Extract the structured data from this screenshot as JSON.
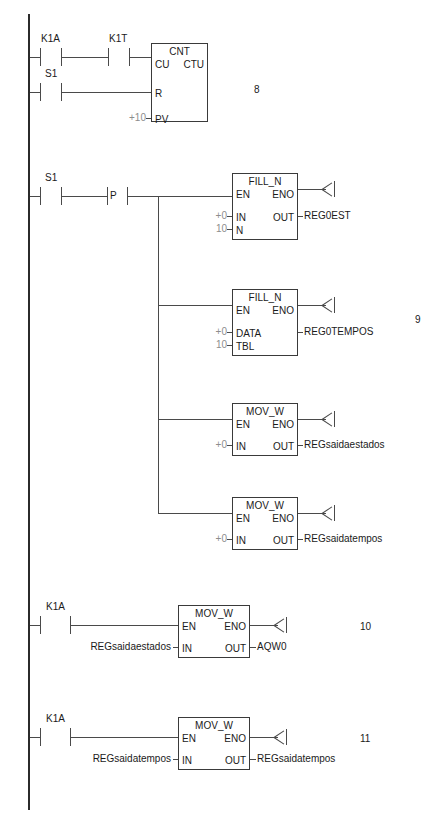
{
  "diagram": {
    "type": "ladder-logic",
    "rungs": [
      {
        "number": "8",
        "contacts": [
          {
            "label": "K1A",
            "type": "normally-open"
          },
          {
            "label": "K1T",
            "type": "normally-open"
          },
          {
            "label": "S1",
            "type": "normally-open"
          }
        ],
        "block": {
          "name": "CNT",
          "type_label": "CTU",
          "inputs": [
            {
              "pin": "CU",
              "operand": ""
            },
            {
              "pin": "R",
              "operand": ""
            },
            {
              "pin": "PV",
              "operand": "+10"
            }
          ],
          "outputs": []
        }
      },
      {
        "number": "9",
        "contacts": [
          {
            "label": "S1",
            "type": "normally-open"
          },
          {
            "label": "P",
            "type": "positive-transition"
          }
        ],
        "blocks": [
          {
            "name": "FILL_N",
            "inputs": [
              {
                "pin": "EN",
                "operand": ""
              },
              {
                "pin": "IN",
                "operand": "+0"
              },
              {
                "pin": "N",
                "operand": "10"
              }
            ],
            "outputs": [
              {
                "pin": "ENO",
                "operand": ""
              },
              {
                "pin": "OUT",
                "operand": "REG0EST"
              }
            ]
          },
          {
            "name": "FILL_N",
            "inputs": [
              {
                "pin": "EN",
                "operand": ""
              },
              {
                "pin": "DATA",
                "operand": "+0"
              },
              {
                "pin": "TBL",
                "operand": "10"
              }
            ],
            "outputs": [
              {
                "pin": "ENO",
                "operand": ""
              },
              {
                "pin": "",
                "operand": "REG0TEMPOS"
              }
            ]
          },
          {
            "name": "MOV_W",
            "inputs": [
              {
                "pin": "EN",
                "operand": ""
              },
              {
                "pin": "IN",
                "operand": "+0"
              }
            ],
            "outputs": [
              {
                "pin": "ENO",
                "operand": ""
              },
              {
                "pin": "OUT",
                "operand": "REGsaidaestados"
              }
            ]
          },
          {
            "name": "MOV_W",
            "inputs": [
              {
                "pin": "EN",
                "operand": ""
              },
              {
                "pin": "IN",
                "operand": "+0"
              }
            ],
            "outputs": [
              {
                "pin": "ENO",
                "operand": ""
              },
              {
                "pin": "OUT",
                "operand": "REGsaidatempos"
              }
            ]
          }
        ]
      },
      {
        "number": "10",
        "contacts": [
          {
            "label": "K1A",
            "type": "normally-open"
          }
        ],
        "block": {
          "name": "MOV_W",
          "inputs": [
            {
              "pin": "EN",
              "operand": ""
            },
            {
              "pin": "IN",
              "operand": "REGsaidaestados"
            }
          ],
          "outputs": [
            {
              "pin": "ENO",
              "operand": ""
            },
            {
              "pin": "OUT",
              "operand": "AQW0"
            }
          ]
        }
      },
      {
        "number": "11",
        "contacts": [
          {
            "label": "K1A",
            "type": "normally-open"
          }
        ],
        "block": {
          "name": "MOV_W",
          "inputs": [
            {
              "pin": "EN",
              "operand": ""
            },
            {
              "pin": "IN",
              "operand": "REGsaidatempos"
            }
          ],
          "outputs": [
            {
              "pin": "ENO",
              "operand": ""
            },
            {
              "pin": "OUT",
              "operand": "REGsaidatempos"
            }
          ]
        }
      }
    ]
  },
  "colors": {
    "rail": "#2b2b2b",
    "wire": "#4a4a4a",
    "text": "#1a1a1a",
    "dim_text": "#8d8d8d",
    "background": "#ffffff"
  }
}
